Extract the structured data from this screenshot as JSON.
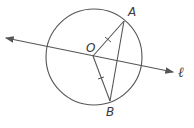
{
  "diagram": {
    "type": "geometry",
    "stroke_color": "#555555",
    "circle": {
      "center_label": "O",
      "cx": 94,
      "cy": 57,
      "r": 48
    },
    "points": [
      {
        "name": "A",
        "x": 124,
        "y": 21,
        "label_x": 128,
        "label_y": 16
      },
      {
        "name": "O",
        "x": 93,
        "y": 56,
        "label_x": 86,
        "label_y": 52
      },
      {
        "name": "B",
        "x": 110,
        "y": 101,
        "label_x": 106,
        "label_y": 116
      }
    ],
    "segments": [
      {
        "from": "O",
        "to": "A",
        "tick_marks": 1
      },
      {
        "from": "O",
        "to": "B",
        "tick_marks": 1
      },
      {
        "from": "A",
        "to": "B",
        "tick_marks": 0
      }
    ],
    "line": {
      "label": "ℓ",
      "x1": 6,
      "y1": 38,
      "x2": 173,
      "y2": 72,
      "arrows": "both",
      "label_x": 178,
      "label_y": 77
    }
  }
}
